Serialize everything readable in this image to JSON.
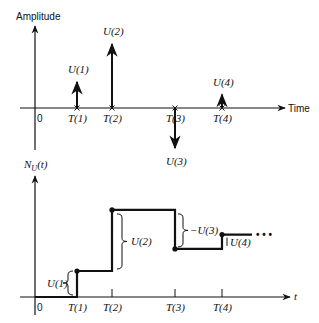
{
  "top_plot": {
    "y_axis_label": "Amplitude",
    "x_axis_label": "Time",
    "origin_label": "0",
    "impulses": [
      {
        "time_label": "T(1)",
        "amp_label": "U(1)",
        "amplitude": 1.0
      },
      {
        "time_label": "T(2)",
        "amp_label": "U(2)",
        "amplitude": 2.35
      },
      {
        "time_label": "T(3)",
        "amp_label": "U(3)",
        "amplitude": -1.5
      },
      {
        "time_label": "T(4)",
        "amp_label": "U(4)",
        "amplitude": 0.55
      }
    ]
  },
  "bottom_plot": {
    "y_axis_label": "N_U(t)",
    "y_axis_label_main": "N",
    "y_axis_label_sub": "U",
    "y_axis_label_arg": "(t)",
    "x_axis_label": "t",
    "origin_label": "0",
    "time_labels": [
      "T(1)",
      "T(2)",
      "T(3)",
      "T(4)"
    ],
    "step_levels": [
      0,
      1.0,
      3.35,
      1.85,
      2.4
    ],
    "brace_labels": [
      "U(1)",
      "U(2)",
      "−U(3)",
      "U(4)"
    ],
    "continuation": "• • •"
  }
}
